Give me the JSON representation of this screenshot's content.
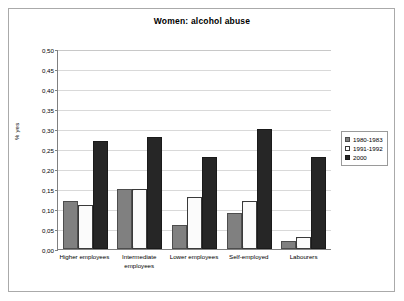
{
  "chart_data": {
    "type": "bar",
    "title": "Women: alcohol abuse",
    "xlabel": "",
    "ylabel": "% yes",
    "categories": [
      "Higher employees",
      "Intermediate employees",
      "Lower employees",
      "Self-employed",
      "Labourers"
    ],
    "series": [
      {
        "name": "1980-1983",
        "values": [
          0.12,
          0.15,
          0.06,
          0.09,
          0.02
        ],
        "color": "#808080"
      },
      {
        "name": "1991-1992",
        "values": [
          0.11,
          0.15,
          0.13,
          0.12,
          0.03
        ],
        "color": "#ffffff"
      },
      {
        "name": "2000",
        "values": [
          0.27,
          0.28,
          0.23,
          0.3,
          0.23
        ],
        "color": "#262626"
      }
    ],
    "ylim": [
      0.0,
      0.5
    ],
    "ytick_values": [
      0.0,
      0.05,
      0.1,
      0.15,
      0.2,
      0.25,
      0.3,
      0.35,
      0.4,
      0.45,
      0.5
    ],
    "ytick_labels": [
      "0,00",
      "0,05",
      "0,10",
      "0,15",
      "0,20",
      "0,25",
      "0,30",
      "0,35",
      "0,40",
      "0,45",
      "0,50"
    ],
    "grid": true,
    "legend_position": "right"
  }
}
